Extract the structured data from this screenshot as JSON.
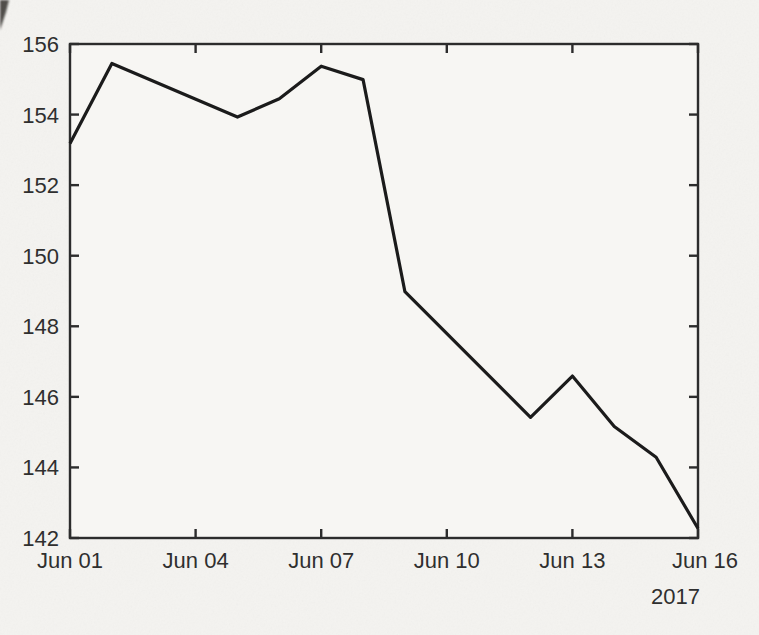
{
  "canvas": {
    "background": "#f4f3f0",
    "plot_background": "#f7f6f3"
  },
  "chart_data": {
    "type": "line",
    "title": "",
    "xlabel": "",
    "ylabel": "",
    "grid": false,
    "legend": false,
    "x_tick_labels": [
      "Jun 01",
      "Jun 04",
      "Jun 07",
      "Jun 10",
      "Jun 13",
      "Jun 16"
    ],
    "x_tick_days": [
      1,
      4,
      7,
      10,
      13,
      16
    ],
    "x_range_days": [
      1,
      16
    ],
    "year_label": "2017",
    "y_ticks": [
      142,
      144,
      146,
      148,
      150,
      152,
      154,
      156
    ],
    "ylim": [
      142,
      156
    ],
    "tick_style": "inward-all-four-sides",
    "line_color": "#1b1b1b",
    "axis_color": "#2c2c2c",
    "label_color": "#2f2f2f",
    "series": [
      {
        "name": "price",
        "points": [
          {
            "date": "Jun 01",
            "day": 1,
            "value": 153.18
          },
          {
            "date": "Jun 02",
            "day": 2,
            "value": 155.45
          },
          {
            "date": "Jun 05",
            "day": 5,
            "value": 153.93
          },
          {
            "date": "Jun 06",
            "day": 6,
            "value": 154.45
          },
          {
            "date": "Jun 07",
            "day": 7,
            "value": 155.37
          },
          {
            "date": "Jun 08",
            "day": 8,
            "value": 154.99
          },
          {
            "date": "Jun 09",
            "day": 9,
            "value": 148.98
          },
          {
            "date": "Jun 12",
            "day": 12,
            "value": 145.42
          },
          {
            "date": "Jun 13",
            "day": 13,
            "value": 146.59
          },
          {
            "date": "Jun 14",
            "day": 14,
            "value": 145.16
          },
          {
            "date": "Jun 15",
            "day": 15,
            "value": 144.29
          },
          {
            "date": "Jun 16",
            "day": 16,
            "value": 142.27
          }
        ]
      }
    ]
  }
}
